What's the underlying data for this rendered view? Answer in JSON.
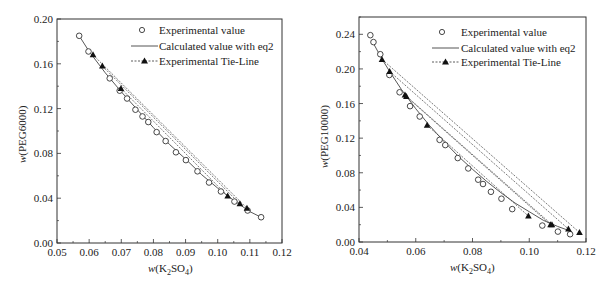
{
  "chart_data": [
    {
      "type": "scatter",
      "id": "left",
      "title": "",
      "xlabel": "w(K2SO4)",
      "ylabel": "w(PEG6000)",
      "xlim": [
        0.05,
        0.12
      ],
      "ylim": [
        0.0,
        0.2
      ],
      "xticks": [
        "0.05",
        "0.06",
        "0.07",
        "0.08",
        "0.09",
        "0.10",
        "0.11",
        "0.12"
      ],
      "yticks": [
        "0.00",
        "0.04",
        "0.08",
        "0.12",
        "0.16",
        "0.20"
      ],
      "grid": false,
      "legend_position": "upper right",
      "legend": [
        "Experimental value",
        "Calculated value with eq2",
        "Experimental Tie-Line"
      ],
      "series": [
        {
          "name": "Experimental value",
          "marker": "open-circle",
          "x": [
            0.0569,
            0.0598,
            0.0664,
            0.0695,
            0.0718,
            0.0744,
            0.0766,
            0.0784,
            0.081,
            0.0838,
            0.087,
            0.0901,
            0.0937,
            0.0973,
            0.101,
            0.1052,
            0.1093,
            0.1135
          ],
          "y": [
            0.185,
            0.171,
            0.147,
            0.136,
            0.129,
            0.119,
            0.113,
            0.108,
            0.099,
            0.091,
            0.081,
            0.074,
            0.064,
            0.054,
            0.046,
            0.037,
            0.029,
            0.023
          ]
        },
        {
          "name": "Calculated value with eq2",
          "marker": "solid-line",
          "x": [
            0.0569,
            0.06,
            0.065,
            0.07,
            0.075,
            0.08,
            0.085,
            0.09,
            0.095,
            0.1,
            0.105,
            0.11,
            0.1135
          ],
          "y": [
            0.185,
            0.171,
            0.152,
            0.135,
            0.119,
            0.103,
            0.088,
            0.075,
            0.061,
            0.049,
            0.038,
            0.028,
            0.023
          ]
        },
        {
          "name": "Experimental Tie-Line",
          "marker": "filled-triangle-dashed",
          "lines": [
            {
              "x": [
                0.0612,
                0.1091
              ],
              "y": [
                0.168,
                0.031
              ]
            },
            {
              "x": [
                0.0641,
                0.1069
              ],
              "y": [
                0.158,
                0.035
              ]
            },
            {
              "x": [
                0.0699,
                0.1031
              ],
              "y": [
                0.138,
                0.042
              ]
            }
          ]
        }
      ]
    },
    {
      "type": "scatter",
      "id": "right",
      "title": "",
      "xlabel": "w(K2SO4)",
      "ylabel": "w(PEG10000)",
      "xlim": [
        0.04,
        0.12
      ],
      "ylim": [
        0.0,
        0.26
      ],
      "xticks": [
        "0.04",
        "0.06",
        "0.08",
        "0.10",
        "0.12"
      ],
      "yticks": [
        "0.00",
        "0.04",
        "0.08",
        "0.12",
        "0.16",
        "0.20",
        "0.24"
      ],
      "grid": false,
      "legend_position": "upper right",
      "legend": [
        "Experimental value",
        "Calculated value with eq2",
        "Experimental Tie-Line"
      ],
      "series": [
        {
          "name": "Experimental value",
          "marker": "open-circle",
          "x": [
            0.044,
            0.0451,
            0.0475,
            0.0507,
            0.0543,
            0.058,
            0.0614,
            0.0684,
            0.0704,
            0.0748,
            0.0785,
            0.082,
            0.0837,
            0.0865,
            0.0902,
            0.094,
            0.1046,
            0.1101,
            0.1144
          ],
          "y": [
            0.239,
            0.231,
            0.217,
            0.193,
            0.173,
            0.157,
            0.145,
            0.118,
            0.112,
            0.097,
            0.085,
            0.072,
            0.067,
            0.058,
            0.05,
            0.038,
            0.019,
            0.012,
            0.009
          ]
        },
        {
          "name": "Calculated value with eq2",
          "marker": "solid-line",
          "x": [
            0.045,
            0.048,
            0.051,
            0.055,
            0.06,
            0.065,
            0.07,
            0.075,
            0.08,
            0.085,
            0.09,
            0.095,
            0.1,
            0.105,
            0.11,
            0.115
          ],
          "y": [
            0.23,
            0.212,
            0.196,
            0.176,
            0.154,
            0.134,
            0.116,
            0.099,
            0.084,
            0.07,
            0.057,
            0.045,
            0.035,
            0.025,
            0.018,
            0.012
          ]
        },
        {
          "name": "Experimental Tie-Line",
          "marker": "filled-triangle-dashed",
          "lines": [
            {
              "x": [
                0.0481,
                0.1177
              ],
              "y": [
                0.211,
                0.011
              ]
            },
            {
              "x": [
                0.0508,
                0.1138
              ],
              "y": [
                0.197,
                0.015
              ]
            },
            {
              "x": [
                0.0562,
                0.108
              ],
              "y": [
                0.17,
                0.02
              ]
            },
            {
              "x": [
                0.0567,
                0.1075
              ],
              "y": [
                0.168,
                0.02
              ]
            },
            {
              "x": [
                0.064,
                0.0997
              ],
              "y": [
                0.135,
                0.03
              ]
            }
          ]
        }
      ]
    }
  ],
  "left": {
    "ylabel_w": "w",
    "ylabel_rest": "(PEG6000)",
    "xlabel_w": "w",
    "xlabel_pre": "(K",
    "xlabel_sub1": "2",
    "xlabel_mid": "SO",
    "xlabel_sub2": "4",
    "xlabel_post": ")"
  },
  "right": {
    "ylabel_w": "w",
    "ylabel_rest": "(PEG10000)",
    "xlabel_w": "w",
    "xlabel_pre": "(K",
    "xlabel_sub1": "2",
    "xlabel_mid": "SO",
    "xlabel_sub2": "4",
    "xlabel_post": ")"
  },
  "legend": {
    "item1": "Experimental value",
    "item2": "Calculated value with eq2",
    "item3": "Experimental Tie-Line"
  }
}
